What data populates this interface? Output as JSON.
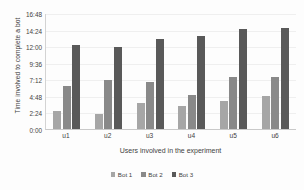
{
  "chart_data": {
    "type": "bar",
    "title": "",
    "xlabel": "Users involved in the experiment",
    "ylabel": "Time involved to complete a bot",
    "categories": [
      "u1",
      "u2",
      "u3",
      "u4",
      "u5",
      "u6"
    ],
    "series": [
      {
        "name": "Bot 1",
        "color": "#a6a6a6",
        "values": [
          2.67,
          2.17,
          3.75,
          3.33,
          4.0,
          4.75
        ]
      },
      {
        "name": "Bot 2",
        "color": "#898989",
        "values": [
          6.25,
          7.17,
          6.75,
          4.92,
          7.5,
          7.58
        ]
      },
      {
        "name": "Bot 3",
        "color": "#595959",
        "values": [
          12.17,
          11.83,
          13.0,
          13.5,
          14.5,
          14.58
        ]
      }
    ],
    "value_unit": "hours (h:mm on axis)",
    "ylim": [
      0,
      16.8
    ],
    "y_tick_labels": [
      "16:48",
      "14:24",
      "12:00",
      "9:36",
      "7:12",
      "4:48",
      "2:24",
      "0:00"
    ],
    "y_tick_values": [
      16.8,
      14.4,
      12.0,
      9.6,
      7.2,
      4.8,
      2.4,
      0
    ],
    "grid": true,
    "legend_position": "bottom"
  }
}
